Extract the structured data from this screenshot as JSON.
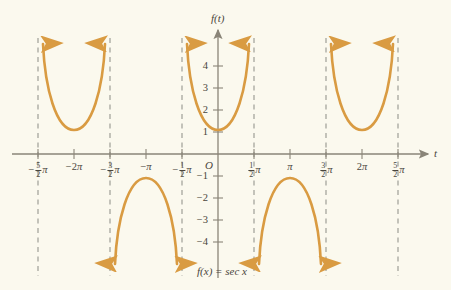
{
  "figure": {
    "caption": "f(x) = sec x",
    "background_color": "#FBF9EE",
    "curve_color": "#D99B42",
    "axis_color": "#8a8578",
    "asymptote_color": "#9b9a93",
    "text_color": "#4a453c"
  },
  "axes": {
    "y_axis_label": "f(t)",
    "x_axis_label": "t",
    "origin_label": "O"
  },
  "chart_data": {
    "type": "line",
    "title": "f(x) = sec x",
    "xlabel": "t",
    "ylabel": "f(t)",
    "grid": false,
    "legend": "none",
    "xlim": [
      -2.75,
      2.75
    ],
    "ylim": [
      -4.7,
      4.7
    ],
    "x_unit": "pi",
    "xtick_values": [
      -2.5,
      -2,
      -1.5,
      -1,
      -0.5,
      0,
      0.5,
      1,
      1.5,
      2,
      2.5
    ],
    "xtick_labels": [
      "-5/2 π",
      "-2π",
      "-3/2 π",
      "-π",
      "-1/2 π",
      "O",
      "1/2 π",
      "π",
      "3/2 π",
      "2π",
      "5/2 π"
    ],
    "ytick_values": [
      4,
      3,
      2,
      1,
      -1,
      -2,
      -3,
      -4
    ],
    "ytick_labels": [
      "4",
      "3",
      "2",
      "1",
      "-1",
      "-2",
      "-3",
      "-4"
    ],
    "asymptotes": {
      "label": "vertical asymptotes at x = (2k+1)π/2",
      "x_values": [
        -2.5,
        -1.5,
        -0.5,
        0.5,
        1.5,
        2.5
      ],
      "style": "dashed"
    },
    "branches": [
      {
        "name": "branch-minus-2pi",
        "center_x": -2,
        "vertex_y": 1,
        "direction": "up",
        "domain": [
          -2.5,
          -1.5
        ]
      },
      {
        "name": "branch-minus-pi",
        "center_x": -1,
        "vertex_y": -1,
        "direction": "down",
        "domain": [
          -1.5,
          -0.5
        ]
      },
      {
        "name": "branch-zero",
        "center_x": 0,
        "vertex_y": 1,
        "direction": "up",
        "domain": [
          -0.5,
          0.5
        ]
      },
      {
        "name": "branch-pi",
        "center_x": 1,
        "vertex_y": -1,
        "direction": "down",
        "domain": [
          0.5,
          1.5
        ]
      },
      {
        "name": "branch-2pi",
        "center_x": 2,
        "vertex_y": 1,
        "direction": "up",
        "domain": [
          1.5,
          2.5
        ]
      }
    ]
  },
  "xticks": [
    {
      "name": "xtick-minus-5-2-pi",
      "num": "5",
      "den": "2",
      "sign": "−",
      "pi": "π",
      "plain": "",
      "left": 38
    },
    {
      "name": "xtick-minus-2pi",
      "num": "",
      "den": "",
      "sign": "−",
      "pi": "π",
      "plain": "2",
      "left": 74
    },
    {
      "name": "xtick-minus-3-2-pi",
      "num": "3",
      "den": "2",
      "sign": "−",
      "pi": "π",
      "plain": "",
      "left": 110
    },
    {
      "name": "xtick-minus-pi",
      "num": "",
      "den": "",
      "sign": "−",
      "pi": "π",
      "plain": "",
      "left": 146
    },
    {
      "name": "xtick-minus-1-2-pi",
      "num": "1",
      "den": "2",
      "sign": "−",
      "pi": "π",
      "plain": "",
      "left": 182
    },
    {
      "name": "xtick-1-2-pi",
      "num": "1",
      "den": "2",
      "sign": "",
      "pi": "π",
      "plain": "",
      "left": 254
    },
    {
      "name": "xtick-pi",
      "num": "",
      "den": "",
      "sign": "",
      "pi": "π",
      "plain": "",
      "left": 290
    },
    {
      "name": "xtick-3-2-pi",
      "num": "3",
      "den": "2",
      "sign": "",
      "pi": "π",
      "plain": "",
      "left": 326
    },
    {
      "name": "xtick-2pi",
      "num": "",
      "den": "",
      "sign": "",
      "pi": "π",
      "plain": "2",
      "left": 362
    },
    {
      "name": "xtick-5-2-pi",
      "num": "5",
      "den": "2",
      "sign": "",
      "pi": "π",
      "plain": "",
      "left": 398
    }
  ],
  "yticks": [
    {
      "name": "ytick-4",
      "label": "4",
      "top": 61
    },
    {
      "name": "ytick-3",
      "label": "3",
      "top": 83
    },
    {
      "name": "ytick-2",
      "label": "2",
      "top": 105
    },
    {
      "name": "ytick-1",
      "label": "1",
      "top": 127
    },
    {
      "name": "ytick-minus-1",
      "label": "−1",
      "top": 171
    },
    {
      "name": "ytick-minus-2",
      "label": "−2",
      "top": 193
    },
    {
      "name": "ytick-minus-3",
      "label": "−3",
      "top": 215
    },
    {
      "name": "ytick-minus-4",
      "label": "−4",
      "top": 237
    }
  ]
}
